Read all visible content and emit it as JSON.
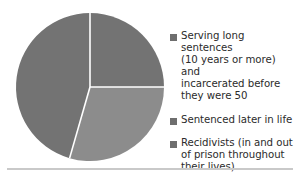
{
  "chart_data": {
    "type": "pie",
    "title": "",
    "subtitle": "",
    "xlabel": "",
    "ylabel": "",
    "grid": false,
    "legend_position": "right",
    "start_angle_deg": 0,
    "direction": "clockwise",
    "center": {
      "x": 90,
      "y": 87
    },
    "radius": 74,
    "separator_color": "#ffffff",
    "labels": [
      "Serving long sentences\n(10 years or more) and\nincarcerated before\nthey were 50",
      "Sentenced later in life",
      "Recidivists (in and out\nof prison throughout\ntheir lives)"
    ],
    "values": [
      25,
      29,
      46
    ],
    "percentages": [
      "25%",
      "29%",
      "46%"
    ],
    "angles_deg": [
      90,
      106,
      164
    ],
    "colors": [
      "#737373",
      "#8c8c8c",
      "#737373"
    ],
    "slices": [
      {
        "name": "Serving long sentences (10 years or more) and incarcerated before they were 50",
        "value": 25,
        "start_deg": 0,
        "end_deg": 90,
        "color": "#737373"
      },
      {
        "name": "Sentenced later in life",
        "value": 29,
        "start_deg": 90,
        "end_deg": 196,
        "color": "#8c8c8c"
      },
      {
        "name": "Recidivists (in and out of prison throughout their lives)",
        "value": 46,
        "start_deg": 196,
        "end_deg": 360,
        "color": "#737373"
      }
    ]
  },
  "legend": {
    "items": [
      {
        "label": "Serving long sentences\n(10 years or more) and\nincarcerated before\nthey were 50",
        "color": "#6e6e6e"
      },
      {
        "label": "Sentenced later in life",
        "color": "#6e6e6e"
      },
      {
        "label": "Recidivists (in and out\nof prison throughout\ntheir lives)",
        "color": "#6e6e6e"
      }
    ]
  },
  "rule": {
    "color": "#c9c9c9"
  }
}
